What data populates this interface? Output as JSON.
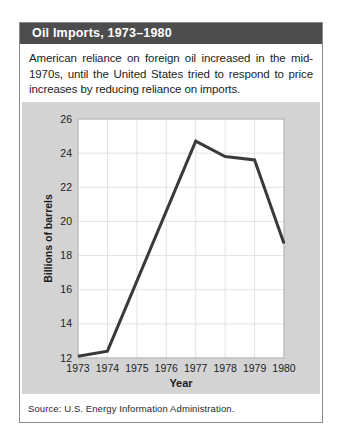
{
  "card": {
    "title": "Oil Imports, 1973–1980",
    "description": "American reliance on foreign oil increased in the mid-1970s, until the United States tried to respond to price increases by reducing reliance on imports.",
    "source": "Source: U.S. Energy Information Administration."
  },
  "colors": {
    "title_bar_bg": "#4d4d4d",
    "title_text": "#ffffff",
    "panel_bg": "#d3d3d3",
    "plot_bg": "#ffffff",
    "grid": "#e2e2e2",
    "frame": "#adadad",
    "line": "#3a3a3a",
    "tick_text": "#1c1c1c"
  },
  "chart_data": {
    "type": "line",
    "x": [
      1973,
      1974,
      1975,
      1976,
      1977,
      1978,
      1979,
      1980
    ],
    "values": [
      12.1,
      12.4,
      16.5,
      20.6,
      24.7,
      23.8,
      23.6,
      18.7
    ],
    "title": "Oil Imports, 1973–1980",
    "xlabel": "Year",
    "ylabel": "Billions of barrels",
    "ylim": [
      12,
      26
    ],
    "yticks": [
      12,
      14,
      16,
      18,
      20,
      22,
      24,
      26
    ],
    "grid": true,
    "legend": "none"
  }
}
